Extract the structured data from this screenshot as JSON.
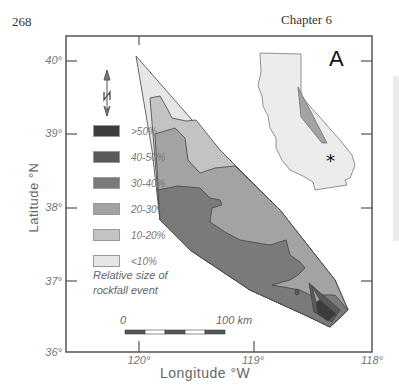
{
  "page": {
    "number": "268",
    "chapter": "Chapter 6"
  },
  "map": {
    "panel_label": "A",
    "y_axis": {
      "label": "Latitude °N",
      "ticks": [
        "40°",
        "39°",
        "38°",
        "37°",
        "36°"
      ]
    },
    "x_axis": {
      "label": "Longitude °W",
      "ticks": [
        "120°",
        "119°",
        "118°"
      ]
    },
    "north_arrow": "N",
    "scale_bar": {
      "start": "0",
      "end": "100 km"
    },
    "inset": {
      "name": "California locator map",
      "marker": "*"
    }
  },
  "legend": {
    "title_line1": "Relative size of",
    "title_line2": "rockfall event",
    "items": [
      {
        "label": ">50%",
        "color": "#3c3c3c"
      },
      {
        "label": "40-50%",
        "color": "#5a5a5a"
      },
      {
        "label": "30-40%",
        "color": "#7a7a7a"
      },
      {
        "label": "20-30%",
        "color": "#a3a3a3"
      },
      {
        "label": "10-20%",
        "color": "#c3c3c3"
      },
      {
        "label": "<10%",
        "color": "#e6e6e6"
      }
    ]
  }
}
